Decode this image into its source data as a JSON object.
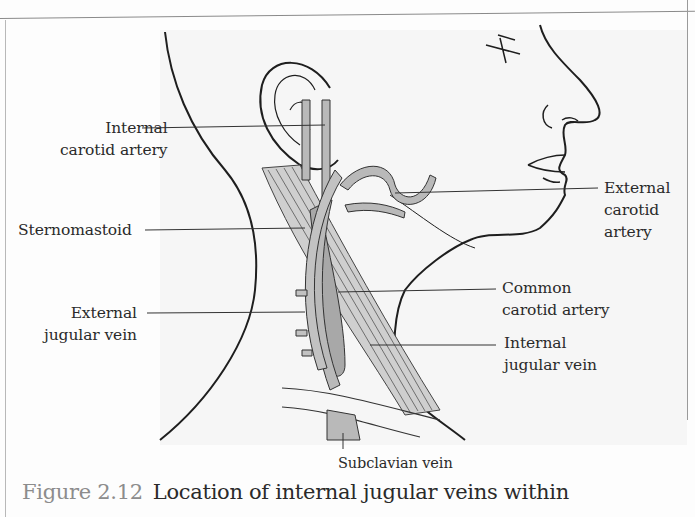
{
  "figure": {
    "number": "Figure 2.12",
    "caption": "Location of internal jugular veins within"
  },
  "labels": {
    "internal_carotid": {
      "line1": "Internal",
      "line2": "carotid artery"
    },
    "sternomastoid": {
      "line1": "Sternomastoid"
    },
    "external_jugular": {
      "line1": "External",
      "line2": "jugular vein"
    },
    "external_carotid": {
      "line1": "External",
      "line2": "carotid",
      "line3": "artery"
    },
    "common_carotid": {
      "line1": "Common",
      "line2": "carotid artery"
    },
    "internal_jugular": {
      "line1": "Internal",
      "line2": "jugular vein"
    },
    "subclavian": {
      "line1": "Subclavian vein"
    }
  },
  "colors": {
    "outline": "#1e1e1e",
    "vessel_fill": "#b9b9b9",
    "muscle_fill": "#a8a8a8",
    "caption_number": "#8c8c8c",
    "text": "#2a2a2a"
  }
}
